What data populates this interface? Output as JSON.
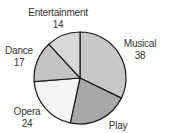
{
  "chart_data": {
    "type": "pie",
    "title": "",
    "categories": [
      "Musical",
      "Play",
      "Opera",
      "Dance",
      "Entertainment"
    ],
    "values": [
      38,
      null,
      24,
      17,
      14
    ],
    "value_labels": [
      "38",
      "",
      "24",
      "17",
      "14"
    ],
    "note": "Play slice value not visible in image (label cut off)",
    "slice_colors": [
      "#c8c8c8",
      "#a8a8a8",
      "#f4f4f4",
      "#c4c4c4",
      "#d8d8d8"
    ],
    "start_angle_deg": 0,
    "direction": "clockwise",
    "legend": "none (direct labels)"
  },
  "render": {
    "estimated_play_value_for_drawing": 25
  },
  "labels": {
    "musical": {
      "name": "Musical",
      "value": "38"
    },
    "play": {
      "name": "Play",
      "value": ""
    },
    "opera": {
      "name": "Opera",
      "value": "24"
    },
    "dance": {
      "name": "Dance",
      "value": "17"
    },
    "entertainment": {
      "name": "Entertainment",
      "value": "14"
    }
  }
}
